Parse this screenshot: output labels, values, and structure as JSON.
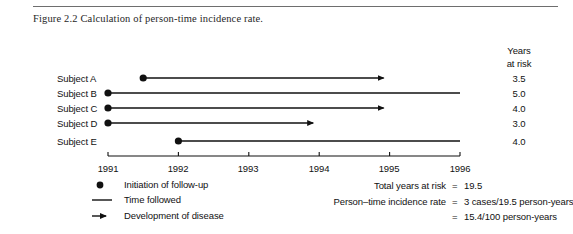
{
  "figure": {
    "caption": "Figure 2.2  Calculation of person-time incidence rate."
  },
  "chart_data": {
    "type": "timeline",
    "title": "Calculation of person-time incidence rate.",
    "xlabel": "",
    "ylabel": "",
    "xlim": [
      1991,
      1996
    ],
    "x_ticks": [
      "1991",
      "1992",
      "1993",
      "1994",
      "1995",
      "1996"
    ],
    "grid": false,
    "legend_position": "bottom-left",
    "years_at_risk_header_line1": "Years",
    "years_at_risk_header_line2": "at risk",
    "subjects": [
      {
        "label": "Subject A",
        "start": 1991.5,
        "end": 1995.0,
        "years_at_risk": "3.5",
        "developed_disease": true
      },
      {
        "label": "Subject B",
        "start": 1991.0,
        "end": 1996.0,
        "years_at_risk": "5.0",
        "developed_disease": false
      },
      {
        "label": "Subject C",
        "start": 1991.0,
        "end": 1995.0,
        "years_at_risk": "4.0",
        "developed_disease": true
      },
      {
        "label": "Subject D",
        "start": 1991.0,
        "end": 1994.0,
        "years_at_risk": "3.0",
        "developed_disease": true
      },
      {
        "label": "Subject E",
        "start": 1992.0,
        "end": 1996.0,
        "years_at_risk": "4.0",
        "developed_disease": false
      }
    ],
    "legend": [
      {
        "glyph": "dot",
        "label": "Initiation of follow-up"
      },
      {
        "glyph": "line",
        "label": "Time followed"
      },
      {
        "glyph": "arrow",
        "label": "Development of disease"
      }
    ],
    "annotations": [
      {
        "label": "Total years at risk",
        "equals": "=",
        "value": "19.5"
      },
      {
        "label": "Person–time incidence rate",
        "equals": "=",
        "value": "3 cases/19.5 person-years"
      },
      {
        "label": "",
        "equals": "=",
        "value": "15.4/100 person-years"
      }
    ]
  }
}
